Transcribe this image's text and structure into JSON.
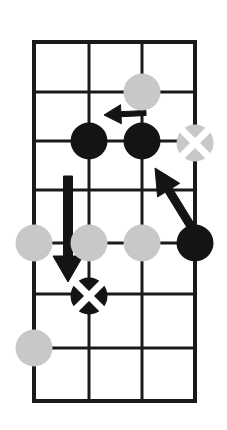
{
  "figure": {
    "title": "Go board tactical diagram",
    "width": 227,
    "height": 430,
    "background_color": "#FFFFFF"
  },
  "board": {
    "line_color": "#1A1A1A",
    "line_width": 3,
    "border_width": 4,
    "columns_x": [
      34,
      89,
      142,
      195
    ],
    "rows_y": [
      42,
      92,
      141,
      190,
      243,
      294,
      348,
      401
    ],
    "column_count": 4,
    "row_count": 8
  },
  "stone_styles": {
    "black_color": "#141414",
    "gray_color": "#C8C8C8",
    "mark_color": "#FFFFFF",
    "diameter": 37
  },
  "stones": [
    {
      "id": "stone-1",
      "color": "gray",
      "mark": "none",
      "col": 2,
      "row": 1,
      "cx": 142,
      "cy": 92,
      "label": "gray-stone-top"
    },
    {
      "id": "stone-2",
      "color": "black",
      "mark": "none",
      "col": 1,
      "row": 2,
      "cx": 89,
      "cy": 141,
      "label": "black-stone-left"
    },
    {
      "id": "stone-3",
      "color": "black",
      "mark": "none",
      "col": 2,
      "row": 2,
      "cx": 142,
      "cy": 141,
      "label": "black-stone-center"
    },
    {
      "id": "stone-4",
      "color": "gray",
      "mark": "cross",
      "col": 3,
      "row": 2,
      "cx": 195,
      "cy": 143,
      "label": "gray-stone-marked-right"
    },
    {
      "id": "stone-5",
      "color": "gray",
      "mark": "none",
      "col": 0,
      "row": 4,
      "cx": 34,
      "cy": 243,
      "label": "gray-stone-row4-col0"
    },
    {
      "id": "stone-6",
      "color": "gray",
      "mark": "none",
      "col": 1,
      "row": 4,
      "cx": 89,
      "cy": 243,
      "label": "gray-stone-row4-col1"
    },
    {
      "id": "stone-7",
      "color": "gray",
      "mark": "none",
      "col": 2,
      "row": 4,
      "cx": 142,
      "cy": 243,
      "label": "gray-stone-row4-col2"
    },
    {
      "id": "stone-8",
      "color": "black",
      "mark": "none",
      "col": 3,
      "row": 4,
      "cx": 195,
      "cy": 243,
      "label": "black-stone-row4-col3"
    },
    {
      "id": "stone-9",
      "color": "black",
      "mark": "cross",
      "col": 1,
      "row": 5,
      "cx": 89,
      "cy": 296,
      "label": "black-stone-marked-lower"
    },
    {
      "id": "stone-10",
      "color": "gray",
      "mark": "none",
      "col": 0,
      "row": 6,
      "cx": 34,
      "cy": 348,
      "label": "gray-stone-bottom-left"
    }
  ],
  "arrows": [
    {
      "id": "arrow-left-short",
      "direction": "left",
      "color": "#141414",
      "from_x": 146,
      "from_y": 113,
      "to_x": 104,
      "to_y": 115,
      "shaft_width": 5,
      "head_length": 17,
      "head_width": 19,
      "label": "arrow-pointing-left"
    },
    {
      "id": "arrow-down-long",
      "direction": "down",
      "color": "#141414",
      "from_x": 68,
      "from_y": 176,
      "to_x": 68,
      "to_y": 282,
      "shaft_width": 9,
      "head_length": 26,
      "head_width": 30,
      "label": "arrow-pointing-down"
    },
    {
      "id": "arrow-diagonal-up-left",
      "direction": "up-left",
      "color": "#141414",
      "from_x": 192,
      "from_y": 228,
      "to_x": 155,
      "to_y": 168,
      "shaft_width": 8,
      "head_length": 26,
      "head_width": 26,
      "label": "arrow-pointing-up-left"
    }
  ]
}
